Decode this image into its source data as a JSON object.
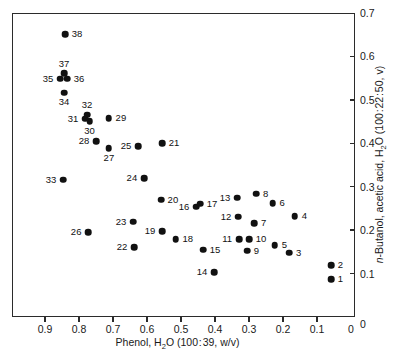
{
  "chart_data": {
    "type": "scatter",
    "title": "",
    "xlabel": "Phenol, H2O (100:39, w/v)",
    "ylabel": "n-Butanol, acetic acid, H2O (100:22:50, v)",
    "xlim": [
      1.0,
      0.0
    ],
    "xlim_note": "x axis is reversed: high values at left",
    "ylim": [
      0.0,
      0.7
    ],
    "grid": false,
    "legend": null,
    "xticks": [
      0.9,
      0.8,
      0.7,
      0.6,
      0.5,
      0.4,
      0.3,
      0.2,
      0.1,
      0.0
    ],
    "xtick_labels": [
      "0.9",
      "0.8",
      "0.7",
      "0.6",
      "0.5",
      "0.4",
      "0.3",
      "0.2",
      "0.1",
      "0"
    ],
    "yticks": [
      0.1,
      0.2,
      0.3,
      0.4,
      0.5,
      0.6,
      0.7
    ],
    "ytick_labels": [
      "0.1",
      "0.2",
      "0.3",
      "0.4",
      "0.5",
      "0.6",
      "0.7"
    ],
    "point_labels_note": "Each marker is annotated with its sample number",
    "points": [
      {
        "label": "1",
        "x": 0.062,
        "y": 0.09,
        "label_pos": "right"
      },
      {
        "label": "2",
        "x": 0.062,
        "y": 0.122,
        "label_pos": "right"
      },
      {
        "label": "3",
        "x": 0.185,
        "y": 0.15,
        "label_pos": "right"
      },
      {
        "label": "4",
        "x": 0.168,
        "y": 0.235,
        "label_pos": "right"
      },
      {
        "label": "5",
        "x": 0.227,
        "y": 0.168,
        "label_pos": "right"
      },
      {
        "label": "6",
        "x": 0.233,
        "y": 0.265,
        "label_pos": "right"
      },
      {
        "label": "7",
        "x": 0.288,
        "y": 0.218,
        "label_pos": "right"
      },
      {
        "label": "8",
        "x": 0.282,
        "y": 0.286,
        "label_pos": "right"
      },
      {
        "label": "9",
        "x": 0.309,
        "y": 0.155,
        "label_pos": "right"
      },
      {
        "label": "10",
        "x": 0.303,
        "y": 0.182,
        "label_pos": "right"
      },
      {
        "label": "11",
        "x": 0.332,
        "y": 0.182,
        "label_pos": "left"
      },
      {
        "label": "12",
        "x": 0.335,
        "y": 0.233,
        "label_pos": "left"
      },
      {
        "label": "13",
        "x": 0.338,
        "y": 0.277,
        "label_pos": "left"
      },
      {
        "label": "14",
        "x": 0.406,
        "y": 0.106,
        "label_pos": "left"
      },
      {
        "label": "15",
        "x": 0.438,
        "y": 0.157,
        "label_pos": "right"
      },
      {
        "label": "16",
        "x": 0.459,
        "y": 0.256,
        "label_pos": "left"
      },
      {
        "label": "17",
        "x": 0.447,
        "y": 0.263,
        "label_pos": "right"
      },
      {
        "label": "18",
        "x": 0.518,
        "y": 0.182,
        "label_pos": "right"
      },
      {
        "label": "19",
        "x": 0.559,
        "y": 0.2,
        "label_pos": "left"
      },
      {
        "label": "20",
        "x": 0.562,
        "y": 0.272,
        "label_pos": "right"
      },
      {
        "label": "21",
        "x": 0.559,
        "y": 0.403,
        "label_pos": "right"
      },
      {
        "label": "22",
        "x": 0.641,
        "y": 0.163,
        "label_pos": "left"
      },
      {
        "label": "23",
        "x": 0.644,
        "y": 0.222,
        "label_pos": "left"
      },
      {
        "label": "24",
        "x": 0.612,
        "y": 0.322,
        "label_pos": "left"
      },
      {
        "label": "25",
        "x": 0.629,
        "y": 0.395,
        "label_pos": "left"
      },
      {
        "label": "26",
        "x": 0.776,
        "y": 0.198,
        "label_pos": "left"
      },
      {
        "label": "27",
        "x": 0.715,
        "y": 0.391,
        "label_pos": "below"
      },
      {
        "label": "28",
        "x": 0.753,
        "y": 0.407,
        "label_pos": "left"
      },
      {
        "label": "29",
        "x": 0.715,
        "y": 0.46,
        "label_pos": "right"
      },
      {
        "label": "30",
        "x": 0.772,
        "y": 0.453,
        "label_pos": "below"
      },
      {
        "label": "31",
        "x": 0.785,
        "y": 0.459,
        "label_pos": "left"
      },
      {
        "label": "32",
        "x": 0.779,
        "y": 0.468,
        "label_pos": "above"
      },
      {
        "label": "33",
        "x": 0.85,
        "y": 0.318,
        "label_pos": "left"
      },
      {
        "label": "34",
        "x": 0.847,
        "y": 0.519,
        "label_pos": "below"
      },
      {
        "label": "35",
        "x": 0.859,
        "y": 0.551,
        "label_pos": "left"
      },
      {
        "label": "36",
        "x": 0.838,
        "y": 0.551,
        "label_pos": "right"
      },
      {
        "label": "37",
        "x": 0.847,
        "y": 0.563,
        "label_pos": "above"
      },
      {
        "label": "38",
        "x": 0.844,
        "y": 0.653,
        "label_pos": "right"
      }
    ]
  }
}
